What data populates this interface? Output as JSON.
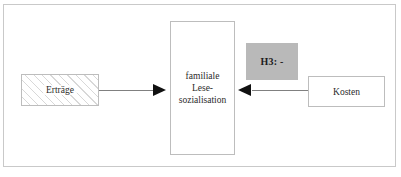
{
  "diagram": {
    "title": "",
    "frame": {
      "border_color": "#c9c9c9"
    },
    "nodes": [
      {
        "id": "ertraege",
        "label": "Erträge",
        "fill": "hatched",
        "border_color": "#bdbdbd"
      },
      {
        "id": "familiale-lesesozialisation",
        "label_line1": "familiale",
        "label_line2": "Lese-",
        "label_line3": "sozialisation",
        "fill": "#ffffff",
        "border_color": "#bdbdbd"
      },
      {
        "id": "kosten",
        "label": "Kosten",
        "fill": "#ffffff",
        "border_color": "#bdbdbd"
      }
    ],
    "annotations": [
      {
        "id": "h3",
        "label": "H3: -",
        "fill": "#b9b9b9",
        "text_color": "#1c1c1c"
      }
    ],
    "edges": [
      {
        "id": "ertraege-to-central",
        "from": "ertraege",
        "to": "familiale-lesesozialisation",
        "direction": "right",
        "color": "#808080"
      },
      {
        "id": "kosten-to-central",
        "from": "kosten",
        "to": "familiale-lesesozialisation",
        "direction": "left",
        "color": "#808080"
      }
    ]
  }
}
